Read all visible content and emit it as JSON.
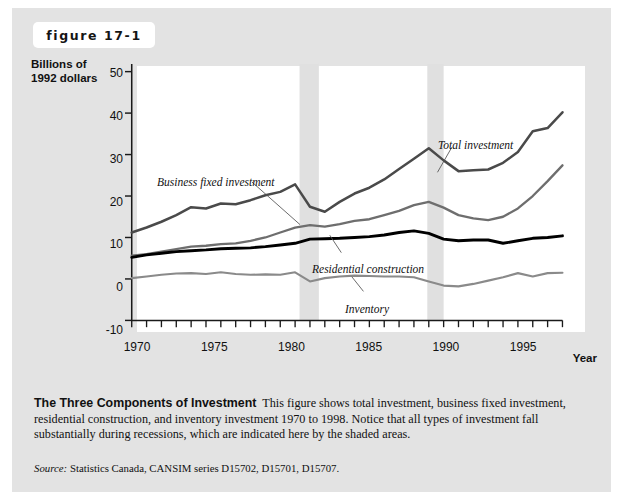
{
  "figure": {
    "tag": "figure 17-1"
  },
  "axis": {
    "y_title_line1": "Billions of",
    "y_title_line2": "1992 dollars",
    "x_title": "Year",
    "y_ticks": [
      "50",
      "40",
      "30",
      "20",
      "10",
      "0",
      "-10"
    ],
    "x_ticks": [
      "1970",
      "1975",
      "1980",
      "1985",
      "1990",
      "1995"
    ]
  },
  "annotations": {
    "total": "Total investment",
    "business": "Business fixed investment",
    "residential": "Residential construction",
    "inventory": "Inventory"
  },
  "caption": {
    "title": "The Three Components of Investment",
    "body": "This figure shows total investment, business fixed investment, residential construction, and inventory investment 1970 to 1998. Notice that all types of investment fall substantially during recessions, which are indicated here by the shaded areas.",
    "source_label": "Source:",
    "source_text": "Statistics Canada, CANSIM series D15702, D15701, D15707."
  },
  "colors": {
    "card_background": "#e3e3e3",
    "plot_background": "#ffffff",
    "recession_band": "#e0e0e0",
    "total_investment_line": "#4a4a4a",
    "business_fixed_line": "#6e6e6e",
    "residential_line": "#000000",
    "inventory_line": "#8a8a8a",
    "axis": "#1a1a1a"
  },
  "chart_data": {
    "type": "line",
    "title": "The Three Components of Investment",
    "xlabel": "Year",
    "ylabel": "Billions of 1992 dollars",
    "xlim": [
      1970,
      1999
    ],
    "ylim": [
      -10,
      50
    ],
    "ytick_step": 10,
    "grid": false,
    "legend": "inline-annotations",
    "x": [
      1970,
      1971,
      1972,
      1973,
      1974,
      1975,
      1976,
      1977,
      1978,
      1979,
      1980,
      1981,
      1982,
      1983,
      1984,
      1985,
      1986,
      1987,
      1988,
      1989,
      1990,
      1991,
      1992,
      1993,
      1994,
      1995,
      1996,
      1997,
      1998,
      1999
    ],
    "recession_bands": [
      {
        "start": 1981.3,
        "end": 1982.6
      },
      {
        "start": 1989.9,
        "end": 1991.0
      }
    ],
    "series": [
      {
        "name": "Total investment",
        "color": "#4a4a4a",
        "values": [
          11.2,
          12.4,
          13.8,
          15.4,
          17.3,
          17.0,
          18.2,
          18.0,
          19.0,
          20.2,
          21.0,
          22.8,
          17.4,
          16.2,
          18.6,
          20.6,
          22.0,
          24.0,
          26.5,
          29.0,
          31.5,
          28.6,
          26.0,
          26.2,
          26.4,
          28.0,
          30.6,
          35.6,
          36.4,
          40.2
        ]
      },
      {
        "name": "Business fixed investment",
        "color": "#6e6e6e",
        "values": [
          5.6,
          6.0,
          6.6,
          7.2,
          7.8,
          8.0,
          8.4,
          8.6,
          9.2,
          10.0,
          11.2,
          12.4,
          13.0,
          12.6,
          13.2,
          14.0,
          14.4,
          15.4,
          16.4,
          17.8,
          18.6,
          17.2,
          15.4,
          14.6,
          14.2,
          15.0,
          17.0,
          20.0,
          23.6,
          27.4
        ]
      },
      {
        "name": "Residential construction",
        "color": "#000000",
        "values": [
          5.2,
          5.8,
          6.2,
          6.6,
          6.8,
          7.0,
          7.3,
          7.4,
          7.5,
          7.8,
          8.2,
          8.6,
          9.6,
          9.7,
          9.8,
          10.0,
          10.2,
          10.6,
          11.2,
          11.6,
          11.0,
          9.6,
          9.2,
          9.4,
          9.4,
          8.6,
          9.2,
          9.8,
          10.0,
          10.4
        ]
      },
      {
        "name": "Inventory",
        "color": "#8a8a8a",
        "values": [
          0.2,
          0.6,
          1.0,
          1.3,
          1.4,
          1.2,
          1.6,
          1.2,
          1.0,
          1.1,
          1.0,
          1.6,
          -0.6,
          0.2,
          0.6,
          0.8,
          0.7,
          0.6,
          0.6,
          0.4,
          -0.6,
          -1.6,
          -1.8,
          -1.2,
          -0.4,
          0.4,
          1.4,
          0.6,
          1.4,
          1.5
        ]
      }
    ]
  }
}
